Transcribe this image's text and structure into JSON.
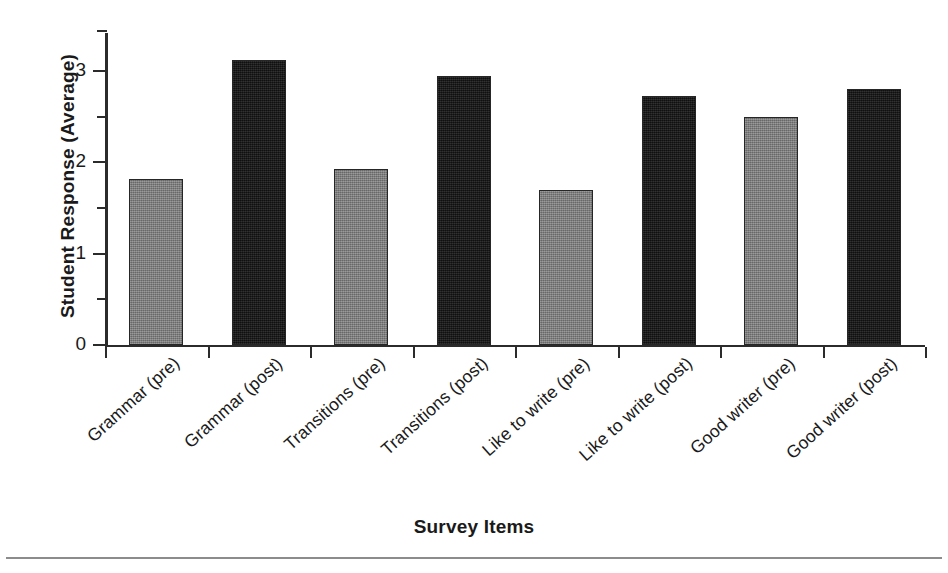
{
  "chart_data": {
    "type": "bar",
    "title": "",
    "xlabel": "Survey Items",
    "ylabel": "Student Response (Average)",
    "categories": [
      "Grammar (pre)",
      "Grammar (post)",
      "Transitions (pre)",
      "Transitions (post)",
      "Like to write (pre)",
      "Like to write (post)",
      "Good writer (pre)",
      "Good writer (post)"
    ],
    "values": [
      1.82,
      3.12,
      1.93,
      2.95,
      1.7,
      2.73,
      2.5,
      2.81
    ],
    "bar_kinds": [
      "pre",
      "post",
      "pre",
      "post",
      "pre",
      "post",
      "pre",
      "post"
    ],
    "ylim": [
      0,
      3.44
    ],
    "ytick_labels": [
      "0",
      "1",
      "2",
      "3"
    ],
    "ytick_values": [
      0,
      1,
      2,
      3
    ],
    "yminor_values": [
      0.5,
      1.5,
      2.5,
      3.44
    ],
    "grid": false,
    "legend": "none",
    "colors": {
      "pre_bar": "#7e7e7e",
      "post_bar": "#181818",
      "bar_outline": "#262626",
      "axis": "#2b2b2b",
      "text": "#1a1a1a",
      "background": "#ffffff",
      "footer_rule": "#8c8c8c"
    }
  }
}
